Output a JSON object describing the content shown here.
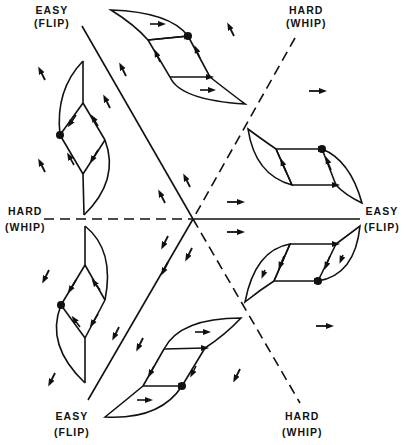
{
  "labels": {
    "top_left": {
      "line1": "EASY",
      "line2": "(FLIP)"
    },
    "top_right": {
      "line1": "HARD",
      "line2": "(WHIP)"
    },
    "left": {
      "line1": "HARD",
      "line2": "(WHIP)"
    },
    "right": {
      "line1": "EASY",
      "line2": "(FLIP)"
    },
    "bottom_left": {
      "line1": "EASY",
      "line2": "(FLIP)"
    },
    "bottom_right": {
      "line1": "HARD",
      "line2": "(WHIP)"
    }
  },
  "axes": {
    "easy_style": "solid",
    "hard_style": "dashed",
    "center": [
      193,
      219
    ]
  },
  "colors": {
    "ink": "#111111",
    "background": "#ffffff"
  },
  "hysteresis_loops": 6,
  "field_arrows": "small magnetization direction arrows in each sector"
}
